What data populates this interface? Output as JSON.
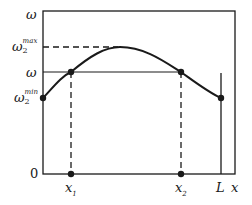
{
  "diagram": {
    "y_axis": {
      "top_label": "ω",
      "max_label": {
        "base": "ω",
        "sub": "2",
        "sup": "max"
      },
      "mid_label": "ω",
      "min_label": {
        "base": "ω",
        "sub": "2",
        "sup": "min"
      },
      "origin_label": "0"
    },
    "x_axis": {
      "x1_label": {
        "base": "x",
        "sub": "1"
      },
      "x2_label": {
        "base": "x",
        "sub": "2"
      },
      "L_label": "L",
      "x_label": "x"
    },
    "colors": {
      "line": "#1a1a1a",
      "background": "#ffffff"
    }
  }
}
